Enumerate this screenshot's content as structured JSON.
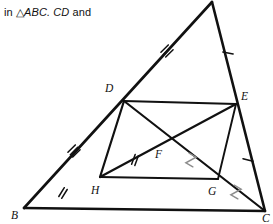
{
  "caption": {
    "prefix": "in ",
    "triangle_symbol": "△",
    "triangle_name": "ABC.",
    "segment": "CD",
    "suffix": "and"
  },
  "figure": {
    "stroke_color": "#111111",
    "soft_mark_color": "#8d8d8d",
    "background": "#ffffff",
    "vertices": [
      {
        "id": "A",
        "label": "A",
        "x": 212,
        "y": 2,
        "label_x": 0,
        "label_y": 0,
        "label_visible": false
      },
      {
        "id": "B",
        "label": "B",
        "x": 24,
        "y": 208,
        "label_x": 11,
        "label_y": 219,
        "label_visible": true
      },
      {
        "id": "C",
        "label": "C",
        "x": 265,
        "y": 211,
        "label_x": 262,
        "label_y": 222,
        "label_visible": true
      },
      {
        "id": "D",
        "label": "D",
        "x": 124,
        "y": 101,
        "label_x": 105,
        "label_y": 92,
        "label_visible": true
      },
      {
        "id": "E",
        "label": "E",
        "x": 236,
        "y": 104,
        "label_x": 241,
        "label_y": 100,
        "label_visible": true
      },
      {
        "id": "F",
        "label": "F",
        "x": 173,
        "y": 145,
        "label_x": 155,
        "label_y": 158,
        "label_visible": true
      },
      {
        "id": "G",
        "label": "G",
        "x": 218,
        "y": 179,
        "label_x": 208,
        "label_y": 195,
        "label_visible": true
      },
      {
        "id": "H",
        "label": "H",
        "x": 100,
        "y": 177,
        "label_x": 91,
        "label_y": 194,
        "label_visible": true
      }
    ],
    "segments": [
      {
        "name": "segment-AB",
        "from": "A",
        "to": "B",
        "weight": "outer"
      },
      {
        "name": "segment-BC",
        "from": "B",
        "to": "C",
        "weight": "outer"
      },
      {
        "name": "segment-AC",
        "from": "A",
        "to": "C",
        "weight": "outer"
      },
      {
        "name": "segment-DE",
        "from": "D",
        "to": "E",
        "weight": "mid"
      },
      {
        "name": "segment-HG",
        "from": "H",
        "to": "G",
        "weight": "mid"
      },
      {
        "name": "segment-DH",
        "from": "D",
        "to": "H",
        "weight": "mid"
      },
      {
        "name": "segment-EG",
        "from": "E",
        "to": "G",
        "weight": "thin"
      },
      {
        "name": "segment-DC",
        "from": "D",
        "to": "C",
        "weight": "mid"
      },
      {
        "name": "segment-HE",
        "from": "H",
        "to": "E",
        "weight": "mid"
      }
    ],
    "tick_marks": [
      {
        "name": "tick-AD",
        "on": "segment-AD",
        "count": 3,
        "style": "straight",
        "color": "dark",
        "x": 167,
        "y": 51,
        "angle": 45
      },
      {
        "name": "tick-BD",
        "on": "segment-BD",
        "count": 3,
        "style": "straight",
        "color": "dark",
        "x": 74,
        "y": 151,
        "angle": 45
      },
      {
        "name": "tick-BH",
        "on": "segment-BH",
        "count": 2,
        "style": "straight",
        "color": "dark",
        "x": 63,
        "y": 193,
        "angle": 32
      },
      {
        "name": "tick-HF",
        "on": "segment-HE",
        "count": 2,
        "style": "straight",
        "color": "dark",
        "x": 135,
        "y": 160,
        "angle": 20
      },
      {
        "name": "tick-AE",
        "on": "segment-AE",
        "count": 1,
        "style": "straight",
        "color": "dark",
        "x": 228,
        "y": 53,
        "angle": 100
      },
      {
        "name": "tick-EC",
        "on": "segment-EC",
        "count": 1,
        "style": "straight",
        "color": "dark",
        "x": 248,
        "y": 160,
        "angle": 105
      },
      {
        "name": "tick-DF",
        "on": "segment-DC",
        "count": 1,
        "style": "zigzag",
        "color": "soft",
        "x": 191,
        "y": 160,
        "angle": 30
      },
      {
        "name": "tick-GC",
        "on": "segment-DC",
        "count": 1,
        "style": "zigzag",
        "color": "soft",
        "x": 236,
        "y": 192,
        "angle": 30
      }
    ]
  }
}
